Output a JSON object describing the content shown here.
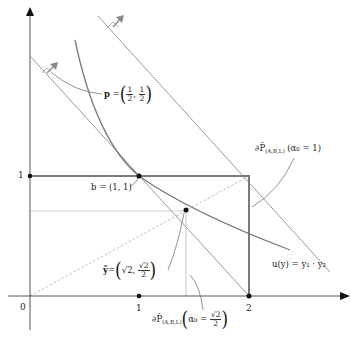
{
  "diagram": {
    "type": "economics-production-possibility",
    "axes": {
      "origin_label": "0",
      "x_ticks": [
        {
          "label": "1",
          "value": 1
        },
        {
          "label": "2",
          "value": 2
        }
      ],
      "y_ticks": [
        {
          "label": "1",
          "value": 1
        }
      ]
    },
    "labels": {
      "price_vector": {
        "prefix": "p",
        "eq": "=",
        "first_num": "1",
        "first_den": "2",
        "second_num": "1",
        "second_den": "2",
        "sep": ","
      },
      "point_b": "b = (1, 1)",
      "point_y": {
        "prefix": "ỹ",
        "eq": "=",
        "first": "√2",
        "sep": ",",
        "second_num": "√2",
        "second_den": "2"
      },
      "frontier_alpha1": {
        "main": "∂P̂",
        "sub": "(A,B,L)",
        "arg": "(α₀ = 1)"
      },
      "frontier_alpha_sqrt": {
        "main": "∂P̂",
        "sub": "(A,B,L)",
        "arg_prefix": "α₀ =",
        "arg_num": "√2",
        "arg_den": "2"
      },
      "utility": "u(y) = y₁ · y₂"
    },
    "points": [
      {
        "name": "b",
        "x": 1,
        "y": 1
      },
      {
        "name": "y_tilde",
        "x": 1.414,
        "y": 0.707
      },
      {
        "name": "x2",
        "x": 2,
        "y": 0
      },
      {
        "name": "x1",
        "x": 1,
        "y": 0
      },
      {
        "name": "y1",
        "x": 0,
        "y": 1
      }
    ],
    "colors": {
      "axis": "#555555",
      "box": "#7a7a7a",
      "curve": "#7a7a7a",
      "light_lines": "#c8c8c8",
      "arrow": "#8a8a8a",
      "dot": "#111111"
    }
  }
}
